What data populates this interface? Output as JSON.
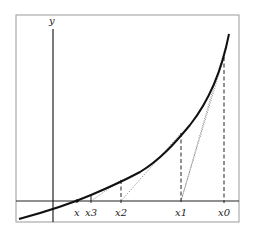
{
  "diagram": {
    "axis_labels": {
      "y": "y"
    },
    "points": [
      {
        "id": "x0",
        "label": "x0",
        "px": 224,
        "curve_y": 57
      },
      {
        "id": "x1",
        "label": "x1",
        "px": 181,
        "curve_y": 133
      },
      {
        "id": "x2",
        "label": "x2",
        "px": 121,
        "curve_y": 180
      },
      {
        "id": "x3",
        "label": "x3",
        "px": 91,
        "curve_y": 195
      },
      {
        "id": "x",
        "label": "x",
        "px": 77,
        "curve_y": 201
      }
    ],
    "colors": {
      "curve": "#111111",
      "axis": "#222222",
      "frame": "#9a9a9a",
      "tangent": "#666666"
    }
  }
}
